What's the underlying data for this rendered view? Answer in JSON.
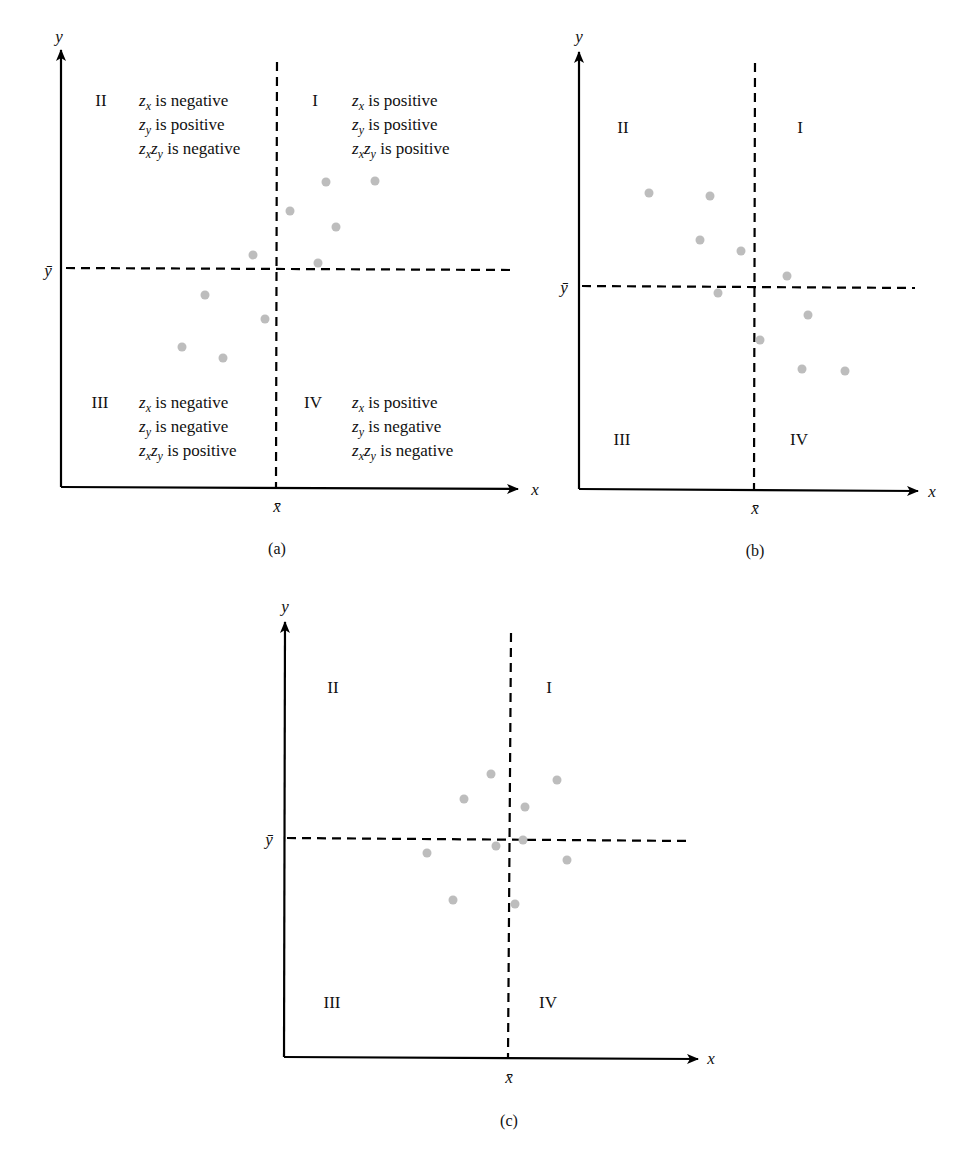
{
  "panels": [
    {
      "id": "a",
      "caption": "(a)",
      "x_axis_label": "x",
      "y_axis_label": "y",
      "x_mean_label": "x̄",
      "y_mean_label": "ȳ",
      "quadrants": {
        "I": {
          "label": "I",
          "lines": [
            {
              "var": "z",
              "sub": "x",
              "text": " is positive"
            },
            {
              "var": "z",
              "sub": "y",
              "text": " is positive"
            },
            {
              "var": "z",
              "sub": "x",
              "var2": "z",
              "sub2": "y",
              "text": " is positive"
            }
          ]
        },
        "II": {
          "label": "II",
          "lines": [
            {
              "var": "z",
              "sub": "x",
              "text": " is negative"
            },
            {
              "var": "z",
              "sub": "y",
              "text": " is positive"
            },
            {
              "var": "z",
              "sub": "x",
              "var2": "z",
              "sub2": "y",
              "text": " is negative"
            }
          ]
        },
        "III": {
          "label": "III",
          "lines": [
            {
              "var": "z",
              "sub": "x",
              "text": " is negative"
            },
            {
              "var": "z",
              "sub": "y",
              "text": " is negative"
            },
            {
              "var": "z",
              "sub": "x",
              "var2": "z",
              "sub2": "y",
              "text": " is positive"
            }
          ]
        },
        "IV": {
          "label": "IV",
          "lines": [
            {
              "var": "z",
              "sub": "x",
              "text": " is positive"
            },
            {
              "var": "z",
              "sub": "y",
              "text": " is negative"
            },
            {
              "var": "z",
              "sub": "x",
              "var2": "z",
              "sub2": "y",
              "text": " is negative"
            }
          ]
        }
      }
    },
    {
      "id": "b",
      "caption": "(b)",
      "x_axis_label": "x",
      "y_axis_label": "y",
      "x_mean_label": "x̄",
      "y_mean_label": "ȳ",
      "quadrants": {
        "I": {
          "label": "I"
        },
        "II": {
          "label": "II"
        },
        "III": {
          "label": "III"
        },
        "IV": {
          "label": "IV"
        }
      }
    },
    {
      "id": "c",
      "caption": "(c)",
      "x_axis_label": "x",
      "y_axis_label": "y",
      "x_mean_label": "x̄",
      "y_mean_label": "ȳ",
      "quadrants": {
        "I": {
          "label": "I"
        },
        "II": {
          "label": "II"
        },
        "III": {
          "label": "III"
        },
        "IV": {
          "label": "IV"
        }
      }
    }
  ],
  "colors": {
    "axis": "#000000",
    "point": "#bdbdbd",
    "background": "#ffffff"
  },
  "chart_data": [
    {
      "type": "scatter",
      "title": "(a) Positive association",
      "xlabel": "x",
      "ylabel": "y",
      "grid": false,
      "reference_lines": {
        "x": "x̄",
        "y": "ȳ"
      },
      "note": "Points in pixel-relative units (origin at axes corner, x̄ at 216, ȳ at 219)",
      "x": [
        229,
        265,
        314,
        275,
        257,
        192,
        144,
        204,
        121,
        162
      ],
      "y": [
        276,
        305,
        306,
        260,
        224,
        232,
        192,
        168,
        140,
        129
      ]
    },
    {
      "type": "scatter",
      "title": "(b) Negative association",
      "xlabel": "x",
      "ylabel": "y",
      "grid": false,
      "reference_lines": {
        "x": "x̄",
        "y": "ȳ"
      },
      "note": "Points in pixel-relative units (origin at axes corner, x̄ at 175, ȳ at 202)",
      "x": [
        70,
        131,
        121,
        162,
        208,
        139,
        229,
        181,
        223,
        266
      ],
      "y": [
        296,
        293,
        249,
        238,
        213,
        196,
        174,
        149,
        120,
        118
      ]
    },
    {
      "type": "scatter",
      "title": "(c) No association",
      "xlabel": "x",
      "ylabel": "y",
      "grid": false,
      "reference_lines": {
        "x": "x̄",
        "y": "ȳ"
      },
      "note": "Points in pixel-relative units (origin at axes corner, x̄ at 226, ȳ at 219)",
      "x": [
        207,
        273,
        180,
        241,
        239,
        212,
        143,
        283,
        169,
        231
      ],
      "y": [
        283,
        277,
        258,
        250,
        217,
        211,
        204,
        197,
        157,
        153
      ]
    }
  ]
}
